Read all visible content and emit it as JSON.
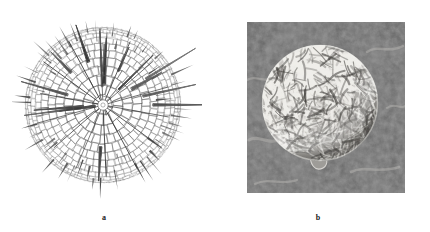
{
  "figure": {
    "width": 430,
    "height": 232,
    "background_color": "#ffffff",
    "kind": "two-panel scientific figure",
    "panels": [
      {
        "id": "a",
        "label": "a",
        "type": "line-drawing",
        "subject": "spherical radiolarian skeleton with latticed shell and radial spines",
        "ink_color": "#3a3a3a",
        "description_features": [
          "polygonal honeycomb lattice over sphere surface",
          "numerous long tapering radial spines",
          "central hub where radial beams converge"
        ],
        "geometry": {
          "center_x": 103,
          "center_y": 105,
          "shell_radius": 77,
          "spine_max_radius": 96,
          "lattice_rings": 9,
          "spine_count": 60
        }
      },
      {
        "id": "b",
        "label": "b",
        "type": "sem-micrograph",
        "subject": "spherical cell with convoluted ridged surface",
        "background_color": "#4a4a4a",
        "highlight_color": "#f0efed",
        "shadow_color": "#2a2a2a",
        "frame": {
          "x": 247,
          "y": 22,
          "width": 158,
          "height": 171
        },
        "sphere": {
          "center_x": 320,
          "center_y": 103,
          "radius": 58
        },
        "scale_bar": {
          "present": true,
          "label": "",
          "x": 349,
          "y": 172,
          "length": 51,
          "color": "#f4f4f4",
          "orientation": "horizontal"
        },
        "description_features": [
          "dark mottled granular background",
          "bright convoluted worm-like surface ridges",
          "bright rim highlight at upper-left",
          "small basal protrusion at bottom of sphere",
          "unlabeled white scale bar at lower right"
        ]
      }
    ]
  },
  "chart_data": {
    "type": "table",
    "title": "",
    "note": "Not a plot; image is a two-panel micrograph/drawing figure."
  }
}
